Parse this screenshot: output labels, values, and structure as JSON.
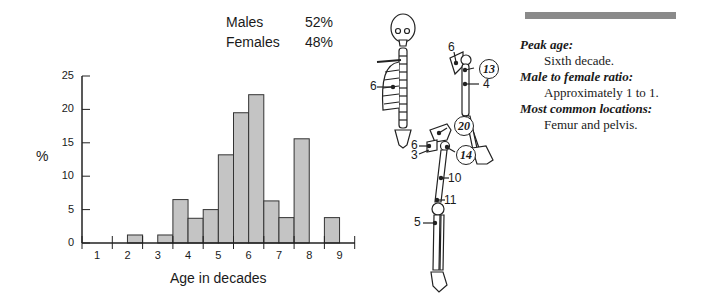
{
  "sex_ratio": {
    "rows": [
      {
        "label": "Males",
        "value": "52%"
      },
      {
        "label": "Females",
        "value": "48%"
      }
    ]
  },
  "chart_data": {
    "type": "bar",
    "title": "",
    "xlabel": "Age in decades",
    "ylabel": "%",
    "ylim": [
      0,
      25
    ],
    "yticks": [
      0,
      5,
      10,
      15,
      20,
      25
    ],
    "xticks": [
      "1",
      "2",
      "3",
      "4",
      "5",
      "6",
      "7",
      "8",
      "9"
    ],
    "grid": false,
    "bin_width_decades": 0.5,
    "bins": [
      {
        "start": 0.5,
        "end": 1.0,
        "value": 0
      },
      {
        "start": 1.0,
        "end": 1.5,
        "value": 0
      },
      {
        "start": 1.5,
        "end": 2.0,
        "value": 0
      },
      {
        "start": 2.0,
        "end": 2.5,
        "value": 1.2
      },
      {
        "start": 2.5,
        "end": 3.0,
        "value": 0
      },
      {
        "start": 3.0,
        "end": 3.5,
        "value": 1.2
      },
      {
        "start": 3.5,
        "end": 4.0,
        "value": 6.5
      },
      {
        "start": 4.0,
        "end": 4.5,
        "value": 3.7
      },
      {
        "start": 4.5,
        "end": 5.0,
        "value": 5.0
      },
      {
        "start": 5.0,
        "end": 5.5,
        "value": 13.2
      },
      {
        "start": 5.5,
        "end": 6.0,
        "value": 19.5
      },
      {
        "start": 6.0,
        "end": 6.5,
        "value": 22.2
      },
      {
        "start": 6.5,
        "end": 7.0,
        "value": 6.3
      },
      {
        "start": 7.0,
        "end": 7.5,
        "value": 3.8
      },
      {
        "start": 7.5,
        "end": 8.0,
        "value": 15.6
      },
      {
        "start": 8.0,
        "end": 8.5,
        "value": 0
      },
      {
        "start": 8.5,
        "end": 9.0,
        "value": 3.8
      }
    ],
    "bar_color": "#c4c4c4",
    "bar_edge_color": "#333333"
  },
  "skeleton": {
    "labels": [
      {
        "text": "6",
        "circled": false,
        "x": 370,
        "y": 86
      },
      {
        "text": "6",
        "circled": false,
        "x": 448,
        "y": 47
      },
      {
        "text": "13",
        "circled": true,
        "x": 485,
        "y": 68
      },
      {
        "text": "4",
        "circled": false,
        "x": 483,
        "y": 84
      },
      {
        "text": "20",
        "circled": true,
        "x": 460,
        "y": 125
      },
      {
        "text": "6",
        "circled": false,
        "x": 411,
        "y": 145
      },
      {
        "text": "3",
        "circled": false,
        "x": 411,
        "y": 155
      },
      {
        "text": "14",
        "circled": true,
        "x": 462,
        "y": 154
      },
      {
        "text": "10",
        "circled": false,
        "x": 448,
        "y": 178
      },
      {
        "text": "11",
        "circled": false,
        "x": 444,
        "y": 200
      },
      {
        "text": "5",
        "circled": false,
        "x": 414,
        "y": 222
      }
    ]
  },
  "info": {
    "items": [
      {
        "heading": "Peak age:",
        "text": "Sixth decade."
      },
      {
        "heading": "Male to female ratio:",
        "text": "Approximately 1 to 1."
      },
      {
        "heading": "Most common locations:",
        "text": "Femur and pelvis."
      }
    ]
  }
}
